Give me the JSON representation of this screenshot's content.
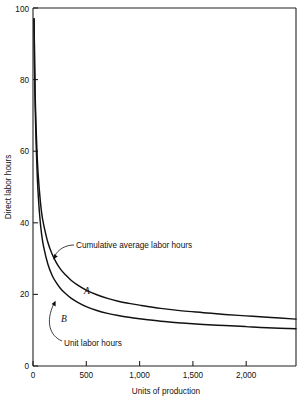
{
  "chart_data": {
    "type": "line",
    "title": "",
    "xlabel": "Units of production",
    "ylabel": "Direct labor hours",
    "xlim": [
      0,
      2470
    ],
    "ylim": [
      0,
      100
    ],
    "grid": false,
    "legend_position": "inline-annotations",
    "x_ticks": [
      0,
      500,
      1000,
      1500,
      2000
    ],
    "x_tick_labels": [
      "0",
      "500",
      "1,000",
      "1,500",
      "2,000"
    ],
    "y_ticks": [
      0,
      20,
      40,
      60,
      80,
      100
    ],
    "y_tick_labels": [
      "0",
      "20",
      "40",
      "60",
      "80",
      "100"
    ],
    "series": [
      {
        "name": "Cumulative average labor hours",
        "letter": "A",
        "x": [
          10,
          20,
          40,
          60,
          80,
          100,
          140,
          180,
          220,
          260,
          300,
          360,
          420,
          500,
          600,
          700,
          800,
          900,
          1000,
          1200,
          1400,
          1600,
          1800,
          2000,
          2200,
          2470
        ],
        "values": [
          97,
          76,
          58,
          49,
          43,
          39.5,
          34.5,
          31.2,
          28.8,
          27.0,
          25.6,
          23.9,
          22.6,
          21.2,
          19.9,
          18.9,
          18.1,
          17.5,
          17.0,
          16.1,
          15.4,
          14.9,
          14.4,
          14.0,
          13.6,
          13.1
        ]
      },
      {
        "name": "Unit labor hours",
        "letter": "B",
        "x": [
          10,
          20,
          40,
          60,
          80,
          100,
          140,
          180,
          220,
          260,
          300,
          360,
          420,
          500,
          600,
          700,
          800,
          900,
          1000,
          1200,
          1400,
          1600,
          1800,
          2000,
          2200,
          2470
        ],
        "values": [
          97,
          73,
          53,
          43,
          37,
          33.3,
          28.4,
          25.3,
          23.2,
          21.6,
          20.4,
          18.9,
          17.8,
          16.6,
          15.5,
          14.7,
          14.1,
          13.6,
          13.2,
          12.5,
          12.0,
          11.6,
          11.3,
          11.0,
          10.7,
          10.4
        ]
      }
    ],
    "annotations": [
      {
        "text": "Cumulative average labor hours",
        "points_to_series": "A"
      },
      {
        "text": "Unit labor hours",
        "points_to_series": "B"
      }
    ]
  },
  "axes": {
    "y_title": "Direct labor hours",
    "x_title": "Units of production"
  },
  "labels": {
    "curve_a": "A",
    "curve_b": "B",
    "anno_cumulative": "Cumulative average labor hours",
    "anno_unit": "Unit labor hours"
  },
  "ticks": {
    "x": [
      "0",
      "500",
      "1,000",
      "1,500",
      "2,000"
    ],
    "y": [
      "0",
      "20",
      "40",
      "60",
      "80",
      "100"
    ]
  },
  "colors": {
    "background": "#ffffff",
    "ink": "#111111",
    "axis": "#222222"
  }
}
